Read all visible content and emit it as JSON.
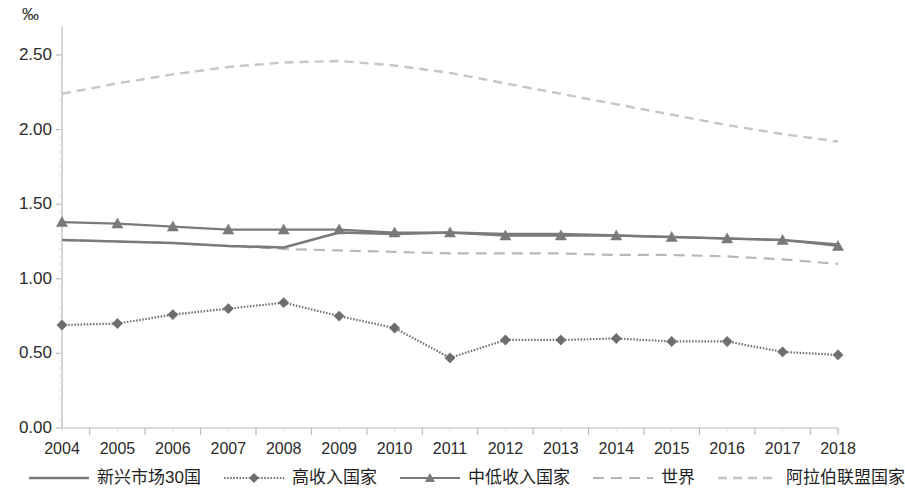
{
  "axis": {
    "unit": "‰",
    "y_ticks": [
      "0.00",
      "0.50",
      "1.00",
      "1.50",
      "2.00",
      "2.50"
    ],
    "x_ticks": [
      "2004",
      "2005",
      "2006",
      "2007",
      "2008",
      "2009",
      "2010",
      "2011",
      "2012",
      "2013",
      "2014",
      "2015",
      "2016",
      "2017",
      "2018"
    ]
  },
  "legend": {
    "items": [
      {
        "label": "新兴市场30国",
        "style": "solid-thick",
        "marker": "none",
        "color": "#7a7a7a"
      },
      {
        "label": "高收入国家",
        "style": "dotted",
        "marker": "diamond",
        "color": "#6e6e6e"
      },
      {
        "label": "中低收入国家",
        "style": "solid",
        "marker": "triangle",
        "color": "#7a7a7a"
      },
      {
        "label": "世界",
        "style": "long-dash",
        "marker": "none",
        "color": "#b4b4b4"
      },
      {
        "label": "阿拉伯联盟国家",
        "style": "short-dash",
        "marker": "none",
        "color": "#c4c4c4"
      }
    ]
  },
  "chart_data": {
    "type": "line",
    "title": "",
    "subtitle": "",
    "xlabel": "",
    "ylabel": "‰",
    "x": [
      2004,
      2005,
      2006,
      2007,
      2008,
      2009,
      2010,
      2011,
      2012,
      2013,
      2014,
      2015,
      2016,
      2017,
      2018
    ],
    "ylim": [
      0.0,
      2.5
    ],
    "yticks": [
      0.0,
      0.5,
      1.0,
      1.5,
      2.0,
      2.5
    ],
    "grid": false,
    "legend_position": "bottom",
    "series": [
      {
        "name": "新兴市场30国",
        "style": "solid-thick",
        "marker": "none",
        "color": "#7a7a7a",
        "values": [
          1.26,
          1.25,
          1.24,
          1.22,
          1.21,
          1.31,
          1.3,
          1.31,
          1.3,
          1.3,
          1.29,
          1.28,
          1.27,
          1.26,
          1.23
        ]
      },
      {
        "name": "高收入国家",
        "style": "dotted",
        "marker": "diamond",
        "color": "#6e6e6e",
        "values": [
          0.69,
          0.7,
          0.76,
          0.8,
          0.84,
          0.75,
          0.67,
          0.47,
          0.59,
          0.59,
          0.6,
          0.58,
          0.58,
          0.51,
          0.49
        ]
      },
      {
        "name": "中低收入国家",
        "style": "solid",
        "marker": "triangle",
        "color": "#7a7a7a",
        "values": [
          1.38,
          1.37,
          1.35,
          1.33,
          1.33,
          1.33,
          1.31,
          1.31,
          1.29,
          1.29,
          1.29,
          1.28,
          1.27,
          1.26,
          1.22
        ]
      },
      {
        "name": "世界",
        "style": "long-dash",
        "marker": "none",
        "color": "#b8b8b8",
        "values": [
          1.26,
          1.25,
          1.24,
          1.22,
          1.2,
          1.19,
          1.18,
          1.17,
          1.17,
          1.17,
          1.16,
          1.16,
          1.15,
          1.13,
          1.1
        ]
      },
      {
        "name": "阿拉伯联盟国家",
        "style": "short-dash",
        "marker": "none",
        "color": "#c6c6c6",
        "values": [
          2.24,
          2.31,
          2.37,
          2.42,
          2.45,
          2.46,
          2.43,
          2.38,
          2.31,
          2.24,
          2.17,
          2.1,
          2.03,
          1.97,
          1.92
        ]
      }
    ]
  }
}
